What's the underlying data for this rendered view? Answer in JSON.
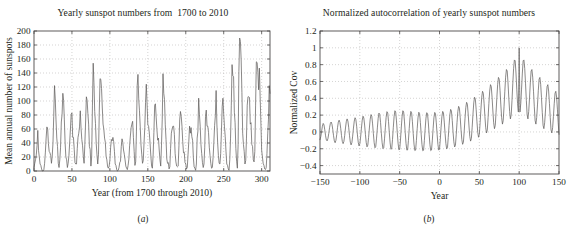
{
  "figure": {
    "background": "#ffffff",
    "line_color": "#5d5a59",
    "axis_color": "#4d4a49",
    "grid_color": "#b9b7b6"
  },
  "panels": [
    {
      "caption": "(a)",
      "caption_open": "(",
      "caption_letter": "a",
      "caption_close": ")"
    },
    {
      "caption": "(b)",
      "caption_open": "(",
      "caption_letter": "b",
      "caption_close": ")"
    }
  ],
  "chart_data": [
    {
      "type": "line",
      "title": "Yearly sunspot numbers from  1700 to 2010",
      "xlabel": "Year (from 1700 through 2010)",
      "ylabel": "Mean annual number of sunspots",
      "xlim": [
        0,
        311
      ],
      "ylim": [
        0,
        200
      ],
      "xticks": [
        0,
        50,
        100,
        150,
        200,
        250,
        300
      ],
      "yticks": [
        0,
        20,
        40,
        60,
        80,
        100,
        120,
        140,
        160,
        180,
        200
      ],
      "xticklabels": [
        "0",
        "50",
        "100",
        "150",
        "200",
        "250",
        "300"
      ],
      "yticklabels": [
        "0",
        "20",
        "40",
        "60",
        "80",
        "100",
        "120",
        "140",
        "160",
        "180",
        "200"
      ],
      "grid": true,
      "legend": "none",
      "x_start": 0,
      "x_step": 1,
      "values": [
        5,
        11,
        16,
        23,
        36,
        58,
        29,
        20,
        10,
        8,
        3,
        0,
        0,
        2,
        11,
        27,
        47,
        63,
        60,
        39,
        28,
        26,
        22,
        11,
        21,
        40,
        78,
        122,
        103,
        73,
        47,
        35,
        11,
        5,
        16,
        34,
        70,
        81,
        111,
        101,
        73,
        40,
        20,
        16,
        5,
        11,
        22,
        40,
        60,
        81,
        83,
        48,
        48,
        31,
        12,
        10,
        10,
        32,
        48,
        54,
        63,
        86,
        61,
        45,
        36,
        21,
        11,
        38,
        70,
        106,
        101,
        82,
        67,
        35,
        31,
        7,
        20,
        93,
        154,
        126,
        85,
        68,
        39,
        23,
        10,
        24,
        83,
        132,
        131,
        118,
        90,
        67,
        60,
        47,
        41,
        21,
        16,
        6,
        4,
        7,
        15,
        34,
        45,
        43,
        48,
        42,
        28,
        10,
        8,
        2,
        0,
        1,
        5,
        12,
        14,
        35,
        46,
        41,
        30,
        24,
        16,
        7,
        4,
        2,
        8,
        17,
        36,
        50,
        62,
        67,
        71,
        48,
        28,
        8,
        13,
        57,
        122,
        138,
        103,
        86,
        63,
        37,
        24,
        11,
        15,
        40,
        62,
        98,
        124,
        96,
        66,
        64,
        54,
        39,
        21,
        7,
        4,
        23,
        55,
        94,
        96,
        77,
        59,
        44,
        47,
        30,
        16,
        7,
        37,
        74,
        139,
        111,
        102,
        66,
        45,
        17,
        11,
        12,
        3,
        6,
        32,
        54,
        60,
        64,
        64,
        52,
        25,
        13,
        7,
        6,
        7,
        36,
        73,
        85,
        78,
        64,
        42,
        26,
        27,
        12,
        10,
        3,
        5,
        24,
        42,
        64,
        54,
        62,
        49,
        44,
        19,
        6,
        4,
        1,
        10,
        47,
        57,
        104,
        81,
        64,
        38,
        25,
        12,
        5,
        10,
        34,
        78,
        87,
        64,
        64,
        55,
        34,
        22,
        11,
        4,
        5,
        19,
        41,
        65,
        79,
        115,
        67,
        41,
        22,
        11,
        10,
        25,
        57,
        92,
        104,
        81,
        63,
        49,
        28,
        10,
        8,
        3,
        1,
        16,
        47,
        94,
        152,
        136,
        135,
        84,
        69,
        32,
        14,
        4,
        38,
        142,
        190,
        185,
        159,
        112,
        54,
        38,
        28,
        10,
        15,
        47,
        94,
        106,
        106,
        105,
        67,
        69,
        38,
        35,
        16,
        13,
        28,
        93,
        156,
        155,
        141,
        116,
        147,
        106,
        70,
        30,
        20,
        11,
        8,
        3,
        2,
        5,
        25,
        53,
        74,
        122,
        111,
        104,
        64,
        41,
        30,
        14,
        9,
        3,
        2,
        6,
        25
      ]
    },
    {
      "type": "line",
      "title": "Normalized autocorrelation of yearly sunspot numbers",
      "xlabel": "Year",
      "ylabel": "Normalized Cov",
      "xlim": [
        -150,
        150
      ],
      "ylim": [
        -0.5,
        1.2
      ],
      "xticks": [
        -150,
        -100,
        -50,
        0,
        50,
        100,
        150
      ],
      "yticks": [
        -0.4,
        -0.2,
        0,
        0.2,
        0.4,
        0.6,
        0.8,
        1,
        1.2
      ],
      "xticklabels": [
        "−150",
        "−100",
        "−50",
        "0",
        "50",
        "100",
        "150"
      ],
      "yticklabels": [
        "−0.4",
        "−0.2",
        "0",
        "0.2",
        "0.4",
        "0.6",
        "0.8",
        "1",
        "1.2"
      ],
      "grid": true,
      "legend": "none",
      "x_start": -150,
      "x_step": 1,
      "peak_value": 1,
      "peak_lag": 0,
      "period_years": 11,
      "values": [
        -0.092,
        -0.055,
        0.005,
        0.068,
        0.101,
        0.084,
        0.025,
        -0.046,
        -0.096,
        -0.106,
        -0.077,
        -0.018,
        0.05,
        0.102,
        0.118,
        0.092,
        0.03,
        -0.045,
        -0.106,
        -0.128,
        -0.1,
        -0.032,
        0.051,
        0.117,
        0.14,
        0.113,
        0.043,
        -0.043,
        -0.112,
        -0.139,
        -0.112,
        -0.042,
        0.047,
        0.122,
        0.155,
        0.13,
        0.056,
        -0.04,
        -0.12,
        -0.154,
        -0.128,
        -0.05,
        0.046,
        0.129,
        0.169,
        0.147,
        0.068,
        -0.035,
        -0.124,
        -0.166,
        -0.142,
        -0.057,
        0.046,
        0.14,
        0.187,
        0.166,
        0.082,
        -0.028,
        -0.126,
        -0.177,
        -0.157,
        -0.065,
        0.047,
        0.152,
        0.206,
        0.187,
        0.096,
        -0.021,
        -0.128,
        -0.188,
        -0.172,
        -0.073,
        0.048,
        0.162,
        0.224,
        0.208,
        0.111,
        -0.014,
        -0.129,
        -0.198,
        -0.187,
        -0.082,
        0.05,
        0.173,
        0.241,
        0.227,
        0.124,
        -0.008,
        -0.13,
        -0.206,
        -0.2,
        -0.09,
        0.05,
        0.18,
        0.252,
        0.238,
        0.131,
        -0.006,
        -0.133,
        -0.212,
        -0.208,
        -0.096,
        0.047,
        0.18,
        0.252,
        0.237,
        0.129,
        -0.01,
        -0.138,
        -0.216,
        -0.213,
        -0.1,
        0.042,
        0.174,
        0.244,
        0.228,
        0.121,
        -0.018,
        -0.145,
        -0.221,
        -0.216,
        -0.102,
        0.038,
        0.167,
        0.234,
        0.218,
        0.112,
        -0.026,
        -0.151,
        -0.224,
        -0.217,
        -0.102,
        0.037,
        0.164,
        0.229,
        0.213,
        0.107,
        -0.029,
        -0.152,
        -0.223,
        -0.214,
        -0.098,
        0.042,
        0.168,
        0.232,
        0.215,
        0.108,
        -0.027,
        -0.148,
        -0.216,
        -0.205,
        -0.087,
        0.055,
        0.181,
        0.244,
        0.226,
        0.117,
        -0.018,
        -0.136,
        -0.201,
        -0.187,
        -0.066,
        0.078,
        0.205,
        0.268,
        0.248,
        0.137,
        0.001,
        -0.117,
        -0.178,
        -0.159,
        -0.034,
        0.112,
        0.241,
        0.304,
        0.283,
        0.17,
        0.031,
        -0.089,
        -0.147,
        -0.123,
        0.006,
        0.156,
        0.288,
        0.352,
        0.33,
        0.214,
        0.071,
        -0.052,
        -0.109,
        -0.079,
        0.055,
        0.209,
        0.345,
        0.412,
        0.389,
        0.269,
        0.122,
        -0.005,
        -0.063,
        -0.028,
        0.111,
        0.271,
        0.412,
        0.483,
        0.459,
        0.335,
        0.183,
        0.05,
        -0.012,
        0.024,
        0.171,
        0.338,
        0.486,
        0.562,
        0.539,
        0.409,
        0.249,
        0.109,
        0.039,
        0.079,
        0.233,
        0.409,
        0.566,
        0.648,
        0.626,
        0.49,
        0.321,
        0.172,
        0.093,
        0.136,
        0.299,
        0.484,
        0.651,
        0.742,
        0.724,
        0.583,
        0.404,
        0.244,
        0.155,
        0.203,
        0.376,
        0.572,
        0.752,
        0.856,
        0.846,
        0.7,
        0.509,
        0.336,
        0.237,
        1.0,
        0.237,
        0.336,
        0.509,
        0.7,
        0.846,
        0.856,
        0.752,
        0.572,
        0.376,
        0.203,
        0.155,
        0.244,
        0.404,
        0.583,
        0.724,
        0.742,
        0.651,
        0.484,
        0.299,
        0.136,
        0.093,
        0.172,
        0.321,
        0.49,
        0.626,
        0.648,
        0.566,
        0.409,
        0.233,
        0.079,
        0.039,
        0.109,
        0.249,
        0.409,
        0.539,
        0.562,
        0.486,
        0.338,
        0.171,
        0.024,
        -0.012,
        0.05,
        0.183,
        0.335,
        0.459,
        0.483,
        0.412,
        0.271,
        0.111,
        -0.028,
        -0.063,
        -0.005,
        0.122,
        0.269,
        0.389,
        0.412,
        0.345,
        0.209,
        0.055,
        -0.079,
        -0.109,
        -0.052,
        0.071,
        0.214,
        0.33,
        0.352,
        0.288,
        0.156,
        0.006,
        -0.123,
        -0.147,
        -0.089,
        0.031,
        0.17,
        0.283,
        0.304,
        0.241,
        0.112,
        -0.034,
        -0.159,
        -0.178,
        -0.117,
        0.001,
        0.137,
        0.248,
        0.268,
        0.205,
        0.078,
        -0.066,
        -0.187,
        -0.201,
        -0.136,
        -0.018,
        0.117,
        0.226,
        0.244,
        0.181,
        0.055,
        -0.087,
        -0.205,
        -0.216,
        -0.148,
        -0.027,
        0.108,
        0.215,
        0.232,
        0.168,
        0.042,
        -0.098,
        -0.214,
        -0.223,
        -0.152,
        -0.029,
        0.107,
        0.213,
        0.229,
        0.164,
        0.037,
        -0.102,
        -0.217,
        -0.224,
        -0.151,
        -0.026,
        0.112,
        0.218,
        0.234,
        0.167,
        0.038,
        -0.102,
        -0.216,
        -0.221,
        -0.145,
        -0.018,
        0.121,
        0.228,
        0.244,
        0.174,
        0.042,
        -0.1,
        -0.213,
        -0.216,
        -0.138,
        -0.01,
        0.129,
        0.237,
        0.252,
        0.18,
        0.047,
        -0.096,
        -0.208,
        -0.212,
        -0.133,
        -0.006,
        0.131,
        0.238,
        0.252,
        0.18,
        0.05,
        -0.09,
        -0.2,
        -0.206,
        -0.13,
        -0.008,
        0.124,
        0.227,
        0.241,
        0.173,
        0.05,
        -0.082,
        -0.187,
        -0.198,
        -0.129,
        -0.014,
        0.111,
        0.208,
        0.224,
        0.162,
        0.048,
        -0.073,
        -0.172,
        -0.188,
        -0.128,
        -0.021,
        0.096,
        0.187,
        0.206,
        0.152,
        0.047,
        -0.065,
        -0.157,
        -0.177,
        -0.126,
        -0.028,
        0.082,
        0.166,
        0.187,
        0.14,
        0.046,
        -0.057,
        -0.142,
        -0.166,
        -0.124,
        -0.035,
        0.068,
        0.147,
        0.169,
        0.129,
        0.046,
        -0.05,
        -0.128,
        -0.154,
        -0.12,
        -0.04,
        0.056,
        0.13,
        0.155,
        0.122,
        0.047,
        -0.042,
        -0.112,
        -0.139,
        -0.112,
        -0.043,
        0.043,
        0.113,
        0.14,
        0.117,
        0.051,
        -0.032,
        -0.1,
        -0.128,
        -0.106,
        -0.045,
        0.03,
        0.092,
        0.118,
        0.102,
        0.05,
        -0.018,
        -0.077,
        -0.106,
        -0.096,
        -0.046,
        0.025,
        0.084,
        0.101,
        0.068,
        0.005,
        -0.055,
        -0.092
      ]
    }
  ]
}
